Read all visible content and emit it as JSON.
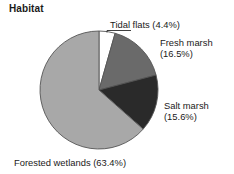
{
  "chart_data": {
    "type": "pie",
    "title": "Habitat",
    "xlabel": "",
    "ylabel": "",
    "grid": false,
    "legend_position": "none",
    "labels_inline": true,
    "start_angle_deg": 0,
    "direction": "clockwise",
    "categories": [
      "Tidal flats",
      "Fresh marsh",
      "Salt marsh",
      "Forested wetlands"
    ],
    "values": [
      4.4,
      16.5,
      15.6,
      63.4
    ],
    "value_unit": "%",
    "colors": [
      "#ffffff",
      "#6a6a6a",
      "#2a2a2a",
      "#a8a8a8"
    ],
    "slices": [
      {
        "name": "Tidal flats",
        "value": 4.4,
        "color": "#ffffff",
        "label": "Tidal flats (4.4%)",
        "label_line1": "Tidal flats (4.4%)",
        "label_line2": "",
        "has_leader_line": true
      },
      {
        "name": "Fresh marsh",
        "value": 16.5,
        "color": "#6a6a6a",
        "label": "Fresh marsh (16.5%)",
        "label_line1": "Fresh marsh",
        "label_line2": "(16.5%)",
        "has_leader_line": false
      },
      {
        "name": "Salt marsh",
        "value": 15.6,
        "color": "#2a2a2a",
        "label": "Salt marsh (15.6%)",
        "label_line1": "Salt marsh",
        "label_line2": "(15.6%)",
        "has_leader_line": false
      },
      {
        "name": "Forested wetlands",
        "value": 63.4,
        "color": "#a8a8a8",
        "label": "Forested wetlands (63.4%)",
        "label_line1": "Forested wetlands (63.4%)",
        "label_line2": "",
        "has_leader_line": false
      }
    ],
    "geometry": {
      "center_x": 99,
      "center_y": 90,
      "radius": 59,
      "outline_color": "#555555"
    }
  }
}
